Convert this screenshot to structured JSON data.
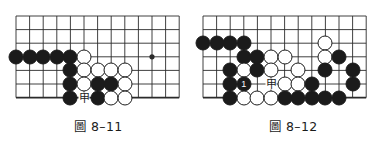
{
  "page": {
    "background_color": "#ffffff",
    "stone_black_color": "#1b1b1b",
    "stone_white_color": "#ffffff",
    "line_color": "#2b2b2b",
    "width": 391,
    "height": 147
  },
  "figures": [
    {
      "id": "figure-8-11",
      "caption": "圖 8–11",
      "board": {
        "origin_x": 16,
        "origin_y": 16,
        "spacing": 13.6,
        "cols": 13,
        "rows": 7,
        "edge_bottom_row": 6,
        "star_points": [
          {
            "col": 10,
            "row": 3
          }
        ],
        "grid_visible": true
      },
      "stones": [
        {
          "color": "black",
          "col": 0,
          "row": 3,
          "label": ""
        },
        {
          "color": "black",
          "col": 1,
          "row": 3,
          "label": ""
        },
        {
          "color": "black",
          "col": 2,
          "row": 3,
          "label": ""
        },
        {
          "color": "black",
          "col": 3,
          "row": 3,
          "label": ""
        },
        {
          "color": "black",
          "col": 4,
          "row": 3,
          "label": ""
        },
        {
          "color": "white",
          "col": 5,
          "row": 3,
          "label": ""
        },
        {
          "color": "black",
          "col": 4,
          "row": 4,
          "label": ""
        },
        {
          "color": "white",
          "col": 5,
          "row": 4,
          "label": ""
        },
        {
          "color": "white",
          "col": 6,
          "row": 4,
          "label": ""
        },
        {
          "color": "white",
          "col": 7,
          "row": 4,
          "label": ""
        },
        {
          "color": "white",
          "col": 8,
          "row": 4,
          "label": ""
        },
        {
          "color": "black",
          "col": 4,
          "row": 5,
          "label": ""
        },
        {
          "color": "white",
          "col": 5,
          "row": 5,
          "label": ""
        },
        {
          "color": "black",
          "col": 6,
          "row": 5,
          "label": ""
        },
        {
          "color": "black",
          "col": 7,
          "row": 5,
          "label": ""
        },
        {
          "color": "white",
          "col": 8,
          "row": 5,
          "label": ""
        },
        {
          "color": "black",
          "col": 4,
          "row": 6,
          "label": ""
        },
        {
          "color": "black",
          "col": 6,
          "row": 6,
          "label": ""
        },
        {
          "color": "white",
          "col": 7,
          "row": 6,
          "label": ""
        },
        {
          "color": "white",
          "col": 8,
          "row": 6,
          "label": ""
        }
      ],
      "point_labels": [
        {
          "text": "甲",
          "col": 5,
          "row": 6
        }
      ]
    },
    {
      "id": "figure-8-12",
      "caption": "圖 8–12",
      "board": {
        "origin_x": 8,
        "origin_y": 16,
        "spacing": 13.6,
        "cols": 13,
        "rows": 7,
        "edge_bottom_row": 6,
        "star_points": [],
        "grid_visible": true
      },
      "stones": [
        {
          "color": "black",
          "col": 0,
          "row": 2,
          "label": ""
        },
        {
          "color": "black",
          "col": 1,
          "row": 2,
          "label": ""
        },
        {
          "color": "black",
          "col": 2,
          "row": 2,
          "label": ""
        },
        {
          "color": "black",
          "col": 3,
          "row": 2,
          "label": ""
        },
        {
          "color": "white",
          "col": 9,
          "row": 2,
          "label": ""
        },
        {
          "color": "black",
          "col": 3,
          "row": 3,
          "label": ""
        },
        {
          "color": "black",
          "col": 4,
          "row": 3,
          "label": ""
        },
        {
          "color": "white",
          "col": 5,
          "row": 3,
          "label": ""
        },
        {
          "color": "white",
          "col": 6,
          "row": 3,
          "label": ""
        },
        {
          "color": "white",
          "col": 9,
          "row": 3,
          "label": ""
        },
        {
          "color": "black",
          "col": 10,
          "row": 3,
          "label": ""
        },
        {
          "color": "black",
          "col": 2,
          "row": 4,
          "label": ""
        },
        {
          "color": "white",
          "col": 3,
          "row": 4,
          "label": ""
        },
        {
          "color": "black",
          "col": 4,
          "row": 4,
          "label": ""
        },
        {
          "color": "white",
          "col": 5,
          "row": 4,
          "label": ""
        },
        {
          "color": "white",
          "col": 7,
          "row": 4,
          "label": ""
        },
        {
          "color": "black",
          "col": 9,
          "row": 4,
          "label": ""
        },
        {
          "color": "black",
          "col": 11,
          "row": 4,
          "label": ""
        },
        {
          "color": "black",
          "col": 2,
          "row": 5,
          "label": ""
        },
        {
          "color": "black",
          "col": 3,
          "row": 5,
          "label": "1"
        },
        {
          "color": "white",
          "col": 6,
          "row": 5,
          "label": ""
        },
        {
          "color": "white",
          "col": 7,
          "row": 5,
          "label": ""
        },
        {
          "color": "black",
          "col": 8,
          "row": 5,
          "label": ""
        },
        {
          "color": "black",
          "col": 11,
          "row": 5,
          "label": ""
        },
        {
          "color": "black",
          "col": 2,
          "row": 6,
          "label": ""
        },
        {
          "color": "white",
          "col": 3,
          "row": 6,
          "label": ""
        },
        {
          "color": "white",
          "col": 4,
          "row": 6,
          "label": ""
        },
        {
          "color": "white",
          "col": 5,
          "row": 6,
          "label": ""
        },
        {
          "color": "black",
          "col": 6,
          "row": 6,
          "label": ""
        },
        {
          "color": "black",
          "col": 7,
          "row": 6,
          "label": ""
        },
        {
          "color": "black",
          "col": 8,
          "row": 6,
          "label": ""
        },
        {
          "color": "black",
          "col": 9,
          "row": 6,
          "label": ""
        },
        {
          "color": "black",
          "col": 10,
          "row": 6,
          "label": ""
        }
      ],
      "point_labels": [
        {
          "text": "甲",
          "col": 5,
          "row": 5
        }
      ]
    }
  ]
}
